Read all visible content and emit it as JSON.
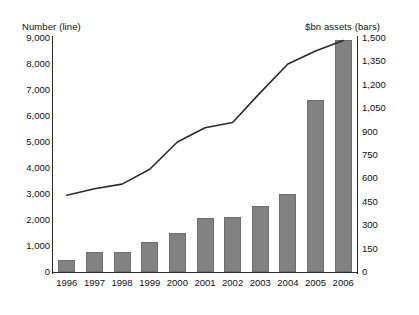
{
  "chart_data": {
    "type": "bar",
    "title": "",
    "categories": [
      "1996",
      "1997",
      "1998",
      "1999",
      "2000",
      "2001",
      "2002",
      "2003",
      "2004",
      "2005",
      "2006"
    ],
    "series": [
      {
        "name": "$bn assets (bars)",
        "type": "bar",
        "axis": "right",
        "values": [
          75,
          130,
          130,
          190,
          250,
          345,
          350,
          425,
          500,
          1100,
          1490
        ]
      },
      {
        "name": "Number (line)",
        "type": "line",
        "axis": "left",
        "values": [
          2950,
          3200,
          3380,
          3950,
          5000,
          5550,
          5750,
          6900,
          8000,
          8500,
          8900
        ]
      }
    ],
    "xlabel": "",
    "ylabel": "Number (line)",
    "y2label": "$bn assets (bars)",
    "ylim": [
      0,
      9000
    ],
    "y2lim": [
      0,
      1500
    ],
    "yticks": [
      "0",
      "1,000",
      "2,000",
      "3,000",
      "4,000",
      "5,000",
      "6,000",
      "7,000",
      "8,000",
      "9,000"
    ],
    "y2ticks": [
      "0",
      "150",
      "300",
      "450",
      "600",
      "750",
      "900",
      "1,050",
      "1,200",
      "1,350",
      "1,500"
    ],
    "grid": false,
    "legend": "none",
    "bar_color": "#828282",
    "line_color": "#2b2b2b"
  },
  "axes": {
    "left_title": "Number (line)",
    "right_title": "$bn assets (bars)"
  }
}
